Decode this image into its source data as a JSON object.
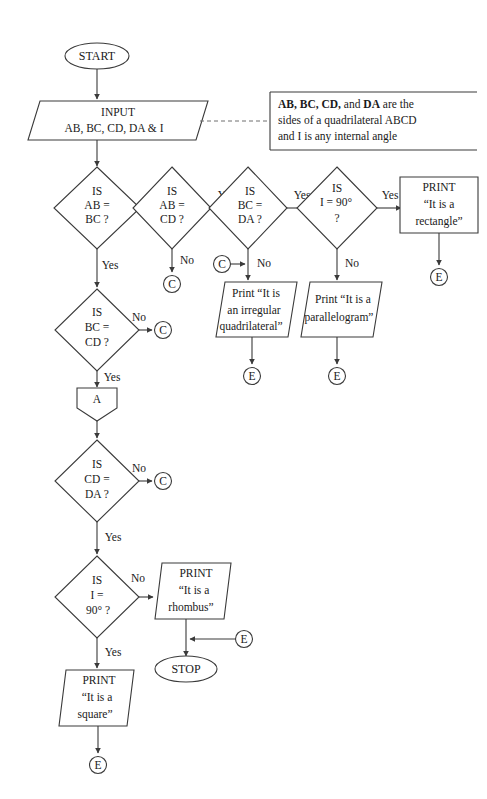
{
  "diagram": {
    "colors": {
      "stroke": "#3a3a3a",
      "text": "#1a1a1a",
      "background": "#ffffff",
      "dashed_note_line": "#6e6e6e"
    }
  },
  "terminals": {
    "start": "START",
    "stop": "STOP"
  },
  "io": {
    "input_line1": "INPUT",
    "input_line2": "AB, BC, CD, DA & I"
  },
  "note": {
    "line1_bold_1": "AB,",
    "line1_bold_2": "BC,",
    "line1_bold_3": "CD,",
    "line1_plain_1": "and",
    "line1_bold_4": "DA",
    "line1_plain_2": "are the",
    "line2": "sides of a quadrilateral ABCD",
    "line3": "and I is any internal angle"
  },
  "decisions": [
    {
      "id": "ab-bc",
      "line1": "IS",
      "line2": "AB =",
      "line3": "BC ?",
      "yes_label": "Yes",
      "no_label": "No"
    },
    {
      "id": "ab-cd",
      "line1": "IS",
      "line2": "AB =",
      "line3": "CD ?",
      "yes_label": "Yes",
      "no_label": "No"
    },
    {
      "id": "bc-da",
      "line1": "IS",
      "line2": "BC =",
      "line3": "DA ?",
      "yes_label": "Yes",
      "no_label": "No"
    },
    {
      "id": "i-90-top",
      "line1": "IS",
      "line2": "I = 90°",
      "line3": "?",
      "yes_label": "Yes",
      "no_label": "No"
    },
    {
      "id": "bc-cd",
      "line1": "IS",
      "line2": "BC =",
      "line3": "CD ?",
      "yes_label": "Yes",
      "no_label": "No"
    },
    {
      "id": "cd-da",
      "line1": "IS",
      "line2": "CD =",
      "line3": "DA ?",
      "yes_label": "Yes",
      "no_label": "No"
    },
    {
      "id": "i-90-bottom",
      "line1": "IS",
      "line2": "I =",
      "line3": "90° ?",
      "yes_label": "Yes",
      "no_label": "No"
    }
  ],
  "outputs": [
    {
      "id": "rectangle",
      "line1": "PRINT",
      "line2": "“It is a",
      "line3": "rectangle”"
    },
    {
      "id": "irregular",
      "line1": "Print “It is",
      "line2": "an irregular",
      "line3": "quadrilateral”"
    },
    {
      "id": "parallelogram",
      "line1": "Print “It is a",
      "line2": "parallelogram”",
      "line3": ""
    },
    {
      "id": "rhombus",
      "line1": "PRINT",
      "line2": "“It is a",
      "line3": "rhombus”"
    },
    {
      "id": "square",
      "line1": "PRINT",
      "line2": "“It is a",
      "line3": "square”"
    }
  ],
  "connectors": {
    "c": "C",
    "e": "E",
    "a": "A"
  },
  "edge_labels": {
    "ab_bc_no": "No",
    "ab_bc_yes": "Yes",
    "ab_cd_yes": "Yes",
    "ab_cd_no": "No",
    "bc_da_yes": "Yes",
    "bc_da_no": "No",
    "i90_top_yes": "Yes",
    "i90_top_no": "No",
    "bc_cd_no": "No",
    "bc_cd_yes": "Yes",
    "cd_da_no": "No",
    "cd_da_yes": "Yes",
    "i90_bot_no": "No",
    "i90_bot_yes": "Yes"
  }
}
